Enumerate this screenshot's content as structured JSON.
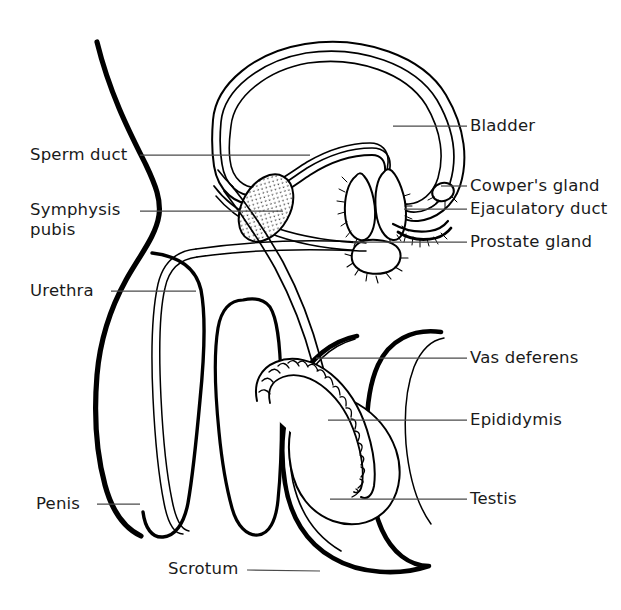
{
  "figure": {
    "type": "anatomical-line-diagram",
    "background_color": "#ffffff",
    "line_color": "#000000",
    "leader_line_color": "#555555",
    "text_color": "#1a1a1a",
    "width": 621,
    "height": 610
  },
  "labels": {
    "left": [
      {
        "id": "sperm-duct",
        "text": "Sperm duct",
        "x": 30,
        "y": 145,
        "leader_from_x": 140,
        "leader_from_y": 155,
        "leader_to_x": 310,
        "leader_to_y": 155
      },
      {
        "id": "symphysis-pubis",
        "line1": "Symphysis",
        "line2": "pubis",
        "text": "Symphysis\npubis",
        "x": 30,
        "y": 200,
        "leader_from_x": 140,
        "leader_from_y": 211,
        "leader_to_x": 283,
        "leader_to_y": 211
      },
      {
        "id": "urethra",
        "text": "Urethra",
        "x": 30,
        "y": 281,
        "leader_from_x": 111,
        "leader_from_y": 291,
        "leader_to_x": 196,
        "leader_to_y": 291
      },
      {
        "id": "penis",
        "text": "Penis",
        "x": 36,
        "y": 494,
        "leader_from_x": 97,
        "leader_from_y": 504,
        "leader_to_x": 140,
        "leader_to_y": 504
      },
      {
        "id": "scrotum",
        "text": "Scrotum",
        "x": 168,
        "y": 559,
        "leader_from_x": 247,
        "leader_from_y": 570,
        "leader_to_x": 320,
        "leader_to_y": 571
      }
    ],
    "right": [
      {
        "id": "bladder",
        "text": "Bladder",
        "x": 470,
        "y": 116,
        "leader_from_x": 393,
        "leader_from_y": 126,
        "leader_to_x": 465,
        "leader_to_y": 126
      },
      {
        "id": "cowpers-gland",
        "text": "Cowper's gland",
        "x": 470,
        "y": 176,
        "leader_from_x": 441,
        "leader_from_y": 186,
        "leader_to_x": 465,
        "leader_to_y": 186
      },
      {
        "id": "ejaculatory-duct",
        "text": "Ejaculatory duct",
        "x": 470,
        "y": 198,
        "leader_from_x": 404,
        "leader_from_y": 208,
        "leader_to_x": 465,
        "leader_to_y": 208
      },
      {
        "id": "prostate-gland",
        "text": "Prostate gland",
        "x": 470,
        "y": 232,
        "leader_from_x": 355,
        "leader_from_y": 242,
        "leader_to_x": 465,
        "leader_to_y": 242
      },
      {
        "id": "vas-deferens",
        "text": "Vas deferens",
        "x": 470,
        "y": 348,
        "leader_from_x": 316,
        "leader_from_y": 358,
        "leader_to_x": 465,
        "leader_to_y": 358
      },
      {
        "id": "epididymis",
        "text": "Epididymis",
        "x": 470,
        "y": 410,
        "leader_from_x": 328,
        "leader_from_y": 420,
        "leader_to_x": 465,
        "leader_to_y": 420
      },
      {
        "id": "testis",
        "text": "Testis",
        "x": 470,
        "y": 489,
        "leader_from_x": 330,
        "leader_from_y": 499,
        "leader_to_x": 465,
        "leader_to_y": 499
      }
    ]
  },
  "structures": [
    {
      "id": "body-outline",
      "name": "abdominal-wall-outline",
      "stroke": 5.0
    },
    {
      "id": "bladder",
      "name": "bladder",
      "stroke": 1.6
    },
    {
      "id": "symphysis-pubis",
      "name": "symphysis-pubis",
      "stroke": 1.6,
      "fill": "stipple"
    },
    {
      "id": "seminal-vesicles",
      "name": "seminal-vesicle",
      "stroke": 1.6
    },
    {
      "id": "prostate-gland",
      "name": "prostate-gland",
      "stroke": 1.6
    },
    {
      "id": "cowpers-gland",
      "name": "cowpers-gland",
      "stroke": 1.6
    },
    {
      "id": "vas-deferens",
      "name": "vas-deferens-tube",
      "stroke": 1.4
    },
    {
      "id": "urethra",
      "name": "urethra-tube",
      "stroke": 1.4
    },
    {
      "id": "penis",
      "name": "penis-shaft",
      "stroke": 3.2
    },
    {
      "id": "scrotum",
      "name": "scrotum-sac",
      "stroke": 4.5
    },
    {
      "id": "testis",
      "name": "testis",
      "stroke": 1.4
    },
    {
      "id": "epididymis",
      "name": "epididymis-coil",
      "stroke": 1.4
    }
  ]
}
